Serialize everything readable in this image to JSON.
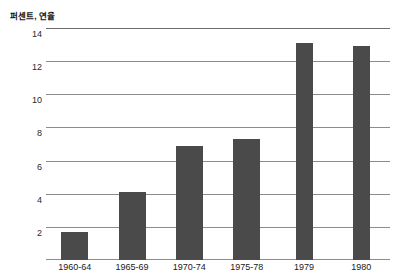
{
  "chart_data": {
    "type": "bar",
    "title": "퍼센트, 연율",
    "xlabel": "",
    "ylabel": "퍼센트, 연율",
    "categories": [
      "1960-64",
      "1965-69",
      "1970-74",
      "1975-78",
      "1979",
      "1980"
    ],
    "values": [
      1.7,
      4.1,
      6.9,
      7.3,
      13.1,
      12.9
    ],
    "yticks": [
      2,
      4,
      6,
      8,
      10,
      12,
      14
    ],
    "ytick_labels": [
      "2",
      "4",
      "6",
      "8",
      "10",
      "12",
      "14"
    ],
    "ylim": [
      0,
      14
    ],
    "grid": true,
    "legend": null,
    "bar_color": "#4a4a4a",
    "grid_color": "#8c8c8c",
    "bar_widths_px": [
      27,
      27,
      27,
      27,
      17,
      17
    ]
  },
  "figure": {
    "unit_title": "퍼센트, 연율"
  }
}
